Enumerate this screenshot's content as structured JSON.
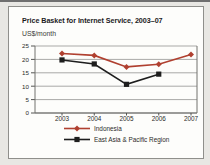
{
  "figure": {
    "title": "Price Basket for Internet Service, 2003–07",
    "subtitle": "US$/month"
  },
  "chart_data": {
    "type": "line",
    "categories": [
      "2003",
      "2004",
      "2005",
      "2006",
      "2007"
    ],
    "series": [
      {
        "name": "Indonesia",
        "color": "#b04030",
        "marker": "diamond",
        "values": [
          22.2,
          21.5,
          17.2,
          18.2,
          21.8
        ]
      },
      {
        "name": "East Asia & Pacific Region",
        "color": "#1e1e1e",
        "marker": "square",
        "values": [
          19.8,
          18.3,
          10.7,
          14.5,
          null
        ]
      }
    ],
    "title": "Price Basket for Internet Service, 2003–07",
    "ylabel": "US$/month",
    "xlabel": "",
    "ylim": [
      0,
      25
    ],
    "yticks": [
      0,
      5,
      10,
      15,
      20,
      25
    ],
    "grid": true,
    "legend_position": "bottom",
    "style_colors": {
      "gridline": "#a9a9a7",
      "zero_axis": "#3b3b39",
      "plot_frame": "#73736f",
      "tick": "#555553",
      "tick_label": "#2b2b29"
    }
  }
}
